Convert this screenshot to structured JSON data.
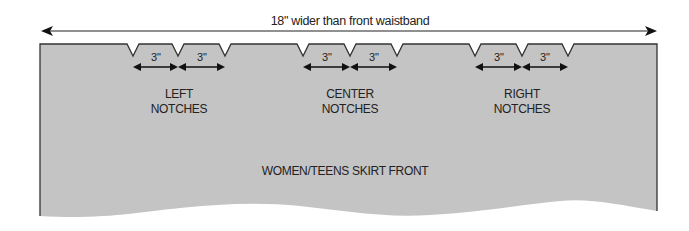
{
  "diagram": {
    "width_annotation": "18\" wider than front waistband",
    "piece_label": "WOMEN/TEENS SKIRT FRONT",
    "notch_spacing_label": "3˝",
    "notch_groups": [
      {
        "label_line1": "LEFT",
        "label_line2": "NOTCHES",
        "spacing": [
          "3\"",
          "3\""
        ]
      },
      {
        "label_line1": "CENTER",
        "label_line2": "NOTCHES",
        "spacing": [
          "3\"",
          "3\""
        ]
      },
      {
        "label_line1": "RIGHT",
        "label_line2": "NOTCHES",
        "spacing": [
          "3\"",
          "3\""
        ]
      }
    ],
    "colors": {
      "fabric": "#c4c4c4",
      "outline": "#333333",
      "text": "#222222"
    }
  }
}
